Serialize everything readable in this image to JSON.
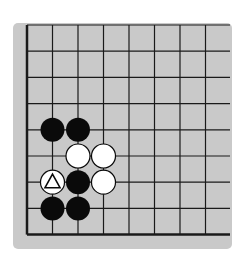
{
  "diagram": {
    "type": "go-board-corner",
    "board_color": "#c9c9c9",
    "line_color": "#1a1a1a",
    "grid": {
      "x_lines": [
        27,
        52.5,
        78,
        103.5,
        129,
        154.5,
        180,
        205.5,
        231
      ],
      "y_lines": [
        25,
        51.2,
        77.4,
        103.6,
        129.8,
        156,
        182.2,
        208.4,
        234.6
      ],
      "edges": [
        "left",
        "bottom"
      ]
    },
    "stones": [
      {
        "color": "black",
        "col": 1,
        "row": 4
      },
      {
        "color": "black",
        "col": 2,
        "row": 4
      },
      {
        "color": "white",
        "col": 2,
        "row": 5
      },
      {
        "color": "white",
        "col": 3,
        "row": 5
      },
      {
        "color": "white",
        "col": 1,
        "row": 6,
        "mark": "triangle"
      },
      {
        "color": "black",
        "col": 2,
        "row": 6
      },
      {
        "color": "white",
        "col": 3,
        "row": 6
      },
      {
        "color": "black",
        "col": 1,
        "row": 7
      },
      {
        "color": "black",
        "col": 2,
        "row": 7
      }
    ]
  }
}
